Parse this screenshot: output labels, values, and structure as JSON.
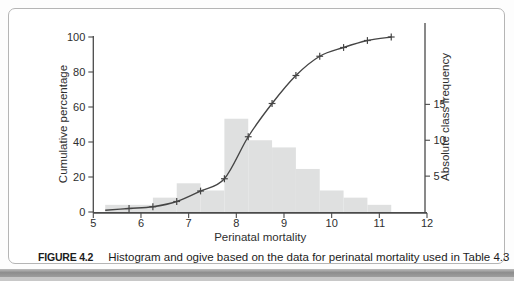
{
  "figure": {
    "caption_label": "FIGURE 4.2",
    "caption_text": "Histogram and ogive based on the data for perinatal mortality used in Table 4.3"
  },
  "chart_data": {
    "type": "bar",
    "subtype": "histogram-with-ogive",
    "title": "",
    "xlabel": "Perinatal mortality",
    "xlim": [
      5,
      12
    ],
    "x_ticks": [
      5,
      6,
      7,
      8,
      9,
      10,
      11,
      12
    ],
    "left_axis": {
      "label": "Cumulative percentage",
      "ticks": [
        0,
        20,
        40,
        60,
        80,
        100
      ],
      "lim": [
        0,
        100
      ]
    },
    "right_axis": {
      "label": "Absolute class frequency",
      "ticks": [
        5,
        10,
        15
      ],
      "percent_per_unit": 4.1
    },
    "histogram": {
      "class_edges": [
        5.25,
        5.75,
        6.25,
        6.75,
        7.25,
        7.75,
        8.25,
        8.75,
        9.25,
        9.75,
        10.25,
        10.75,
        11.25
      ],
      "frequencies": [
        1,
        1,
        2,
        4,
        3,
        13,
        10,
        9,
        6,
        3,
        2,
        1
      ]
    },
    "ogive": {
      "x": [
        5.75,
        6.25,
        6.75,
        7.25,
        7.75,
        8.25,
        8.75,
        9.25,
        9.75,
        10.25,
        10.75,
        11.25
      ],
      "cumulative_percent": [
        2,
        3,
        6,
        12,
        19,
        43,
        62,
        78,
        89,
        94,
        98,
        100
      ],
      "start_point": [
        5.25,
        1
      ],
      "marker": "plus"
    },
    "colors": {
      "bar_fill": "#dfe0e0",
      "line": "#454545",
      "axis": "#4a4a4a",
      "text": "#2e2e2e"
    },
    "legend": "none",
    "grid": false
  }
}
